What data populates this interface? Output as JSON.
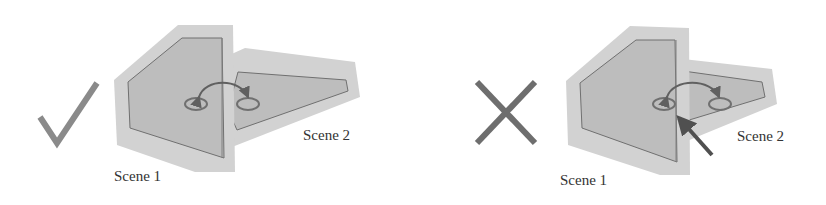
{
  "panels": [
    {
      "verdict": "correct",
      "verdict_icon": "check-icon",
      "scene1_label": "Scene 1",
      "scene2_label": "Scene 2"
    },
    {
      "verdict": "incorrect",
      "verdict_icon": "cross-icon",
      "scene1_label": "Scene 1",
      "scene2_label": "Scene 2"
    }
  ],
  "colors": {
    "outer_fill": "#d2d2d2",
    "inner_fill": "#bdbdbd",
    "outline": "#707070",
    "icon": "#8a8a8a",
    "cross": "#6e6e6e",
    "arrow": "#505050"
  }
}
